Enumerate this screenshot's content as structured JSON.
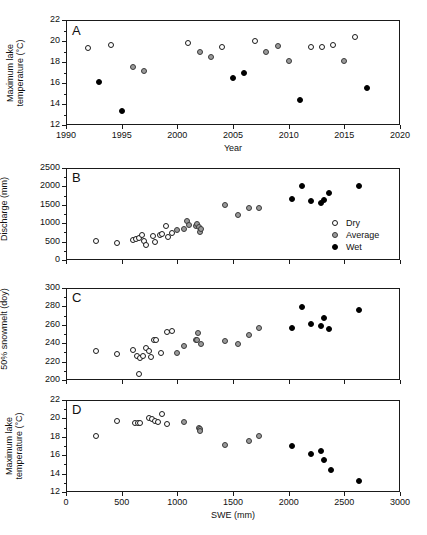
{
  "figure": {
    "panels": [
      "A",
      "B",
      "C",
      "D"
    ],
    "legend": {
      "position": "panel-B-lower-right",
      "entries": [
        {
          "label": "Dry",
          "marker": "open-circle",
          "color": "#ffffff"
        },
        {
          "label": "Average",
          "marker": "gray-circle",
          "color": "#9a9a9a"
        },
        {
          "label": "Wet",
          "marker": "filled-circle",
          "color": "#000000"
        }
      ]
    }
  },
  "chart_data": [
    {
      "type": "scatter",
      "panel": "A",
      "title": "A",
      "xlabel": "Year",
      "ylabel": "Maximum lake temperature (°C)",
      "xlim": [
        1990,
        2020
      ],
      "ylim": [
        12,
        22
      ],
      "xticks": [
        1990,
        1995,
        2000,
        2005,
        2010,
        2015,
        2020
      ],
      "yticks": [
        12,
        14,
        16,
        18,
        20,
        22
      ],
      "grid": false,
      "series": [
        {
          "name": "Dry",
          "points": [
            [
              1992,
              19.3
            ],
            [
              1994,
              19.6
            ],
            [
              2001,
              19.8
            ],
            [
              2004,
              19.4
            ],
            [
              2007,
              20.0
            ],
            [
              2012,
              19.45
            ],
            [
              2013,
              19.45
            ],
            [
              2014,
              19.65
            ],
            [
              2016,
              20.4
            ]
          ]
        },
        {
          "name": "Average",
          "points": [
            [
              1996,
              17.55
            ],
            [
              1997,
              17.15
            ],
            [
              2002,
              19.0
            ],
            [
              2003,
              18.5
            ],
            [
              2008,
              19.0
            ],
            [
              2009,
              19.55
            ],
            [
              2010,
              18.1
            ],
            [
              2015,
              18.1
            ]
          ]
        },
        {
          "name": "Wet",
          "points": [
            [
              1993,
              16.1
            ],
            [
              1995,
              13.35
            ],
            [
              2005,
              16.5
            ],
            [
              2006,
              17.0
            ],
            [
              2011,
              14.4
            ],
            [
              2017,
              15.5
            ]
          ]
        }
      ]
    },
    {
      "type": "scatter",
      "panel": "B",
      "title": "B",
      "xlabel": "SWE (mm)",
      "ylabel": "Discharge (mm)",
      "xlim": [
        0,
        3000
      ],
      "ylim": [
        0,
        2500
      ],
      "xticks": [
        0,
        500,
        1000,
        1500,
        2000,
        2500,
        3000
      ],
      "yticks": [
        0,
        500,
        1000,
        1500,
        2000,
        2500
      ],
      "grid": false,
      "series": [
        {
          "name": "Dry",
          "points": [
            [
              265,
              505
            ],
            [
              455,
              475
            ],
            [
              600,
              545
            ],
            [
              630,
              560
            ],
            [
              660,
              590
            ],
            [
              680,
              670
            ],
            [
              700,
              520
            ],
            [
              720,
              400
            ],
            [
              780,
              655
            ],
            [
              800,
              490
            ],
            [
              840,
              680
            ],
            [
              865,
              700
            ],
            [
              900,
              920
            ],
            [
              915,
              615
            ],
            [
              955,
              725
            ]
          ]
        },
        {
          "name": "Average",
          "points": [
            [
              1000,
              820
            ],
            [
              1060,
              835
            ],
            [
              1090,
              1070
            ],
            [
              1105,
              940
            ],
            [
              1165,
              915
            ],
            [
              1180,
              985
            ],
            [
              1195,
              890
            ],
            [
              1205,
              760
            ],
            [
              1215,
              830
            ],
            [
              1430,
              1490
            ],
            [
              1545,
              1215
            ],
            [
              1640,
              1400
            ],
            [
              1735,
              1420
            ]
          ]
        },
        {
          "name": "Wet",
          "points": [
            [
              2030,
              1650
            ],
            [
              2120,
              2000
            ],
            [
              2200,
              1600
            ],
            [
              2290,
              1540
            ],
            [
              2320,
              1640
            ],
            [
              2360,
              1815
            ],
            [
              2635,
              2000
            ]
          ]
        }
      ]
    },
    {
      "type": "scatter",
      "panel": "C",
      "title": "C",
      "xlabel": "SWE (mm)",
      "ylabel": "50% snowmelt (doy)",
      "xlim": [
        0,
        3000
      ],
      "ylim": [
        200,
        300
      ],
      "xticks": [
        0,
        500,
        1000,
        1500,
        2000,
        2500,
        3000
      ],
      "yticks": [
        200,
        220,
        240,
        260,
        280,
        300
      ],
      "grid": false,
      "series": [
        {
          "name": "Dry",
          "points": [
            [
              265,
              231
            ],
            [
              455,
              228
            ],
            [
              600,
              233
            ],
            [
              640,
              226
            ],
            [
              655,
              206
            ],
            [
              665,
              224
            ],
            [
              690,
              226
            ],
            [
              720,
              235
            ],
            [
              745,
              231
            ],
            [
              760,
              225
            ],
            [
              790,
              244
            ],
            [
              810,
              243
            ],
            [
              855,
              229
            ],
            [
              905,
              252
            ],
            [
              955,
              253
            ]
          ]
        },
        {
          "name": "Average",
          "points": [
            [
              1000,
              229
            ],
            [
              1060,
              237
            ],
            [
              1165,
              244
            ],
            [
              1180,
              243
            ],
            [
              1190,
              251
            ],
            [
              1215,
              239
            ],
            [
              1430,
              242
            ],
            [
              1545,
              239
            ],
            [
              1640,
              249
            ],
            [
              1735,
              256
            ]
          ]
        },
        {
          "name": "Wet",
          "points": [
            [
              2030,
              257
            ],
            [
              2120,
              279
            ],
            [
              2200,
              261
            ],
            [
              2290,
              259
            ],
            [
              2320,
              267
            ],
            [
              2360,
              255
            ],
            [
              2635,
              276
            ]
          ]
        }
      ]
    },
    {
      "type": "scatter",
      "panel": "D",
      "title": "D",
      "xlabel": "SWE (mm)",
      "ylabel": "Maximum lake temperature (°C)",
      "xlim": [
        0,
        3000
      ],
      "ylim": [
        12,
        22
      ],
      "xticks": [
        0,
        500,
        1000,
        1500,
        2000,
        2500,
        3000
      ],
      "yticks": [
        12,
        14,
        16,
        18,
        20,
        22
      ],
      "grid": false,
      "series": [
        {
          "name": "Dry",
          "points": [
            [
              265,
              18.1
            ],
            [
              455,
              19.7
            ],
            [
              620,
              19.45
            ],
            [
              650,
              19.5
            ],
            [
              665,
              19.55
            ],
            [
              745,
              20.0
            ],
            [
              775,
              19.9
            ],
            [
              800,
              19.75
            ],
            [
              830,
              19.65
            ],
            [
              865,
              20.45
            ],
            [
              905,
              19.4
            ]
          ]
        },
        {
          "name": "Average",
          "points": [
            [
              1060,
              19.6
            ],
            [
              1195,
              19.0
            ],
            [
              1200,
              18.85
            ],
            [
              1205,
              18.6
            ],
            [
              1430,
              17.1
            ],
            [
              1640,
              17.5
            ],
            [
              1735,
              18.1
            ]
          ]
        },
        {
          "name": "Wet",
          "points": [
            [
              2030,
              17.0
            ],
            [
              2200,
              16.1
            ],
            [
              2290,
              16.45
            ],
            [
              2320,
              15.5
            ],
            [
              2380,
              14.35
            ],
            [
              2635,
              13.25
            ]
          ]
        }
      ]
    }
  ]
}
